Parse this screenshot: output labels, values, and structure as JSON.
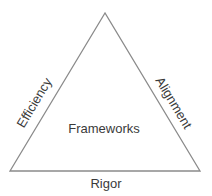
{
  "diagram": {
    "shape": "triangle",
    "center_label": "Frameworks",
    "sides": {
      "left": "Efficiency",
      "right": "Alignment",
      "bottom": "Rigor"
    },
    "colors": {
      "stroke": "#8a8a8a",
      "text": "#3a3a3a",
      "background": "#ffffff"
    }
  }
}
